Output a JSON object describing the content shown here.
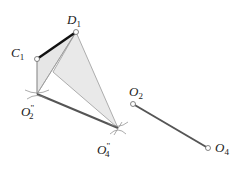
{
  "diagram": {
    "points": {
      "C1": {
        "label": "C",
        "sub": "1",
        "x": 37,
        "y": 59
      },
      "D1": {
        "label": "D",
        "sub": "1",
        "x": 76,
        "y": 32
      },
      "O2pp": {
        "label": "O",
        "sub": "2",
        "sup": "\"",
        "x": 37,
        "y": 94
      },
      "O4pp": {
        "label": "O",
        "sub": "4",
        "sup": "\"",
        "x": 118,
        "y": 128
      },
      "O2": {
        "label": "O",
        "sub": "2",
        "x": 133,
        "y": 104
      },
      "O4": {
        "label": "O",
        "sub": "4",
        "x": 208,
        "y": 148
      }
    },
    "colors": {
      "thick_line": "#111111",
      "link_line": "#555555",
      "thin_line": "#999999",
      "fill": "#e4e4e4"
    }
  }
}
